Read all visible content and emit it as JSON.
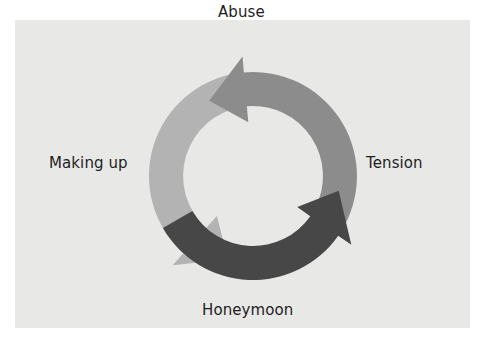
{
  "stages": [
    {
      "id": "abuse",
      "label": "Abuse"
    },
    {
      "id": "tension",
      "label": "Tension"
    },
    {
      "id": "honeymoon",
      "label": "Honeymoon"
    },
    {
      "id": "making-up",
      "label": "Making up"
    }
  ],
  "arrows": [
    {
      "name": "tension-to-abuse-arrow",
      "from": "Tension",
      "to": "Abuse",
      "color": "#8c8c8c"
    },
    {
      "name": "honeymoon-to-tension-arrow",
      "from": "Honeymoon",
      "to": "Tension",
      "color": "#474747"
    },
    {
      "name": "abuse-to-honeymoon-arrow",
      "from": "Abuse",
      "to": "Honeymoon",
      "color": "#b3b3b3"
    }
  ],
  "colors": {
    "background": "#e8e8e6",
    "text": "#1e1e1e"
  }
}
